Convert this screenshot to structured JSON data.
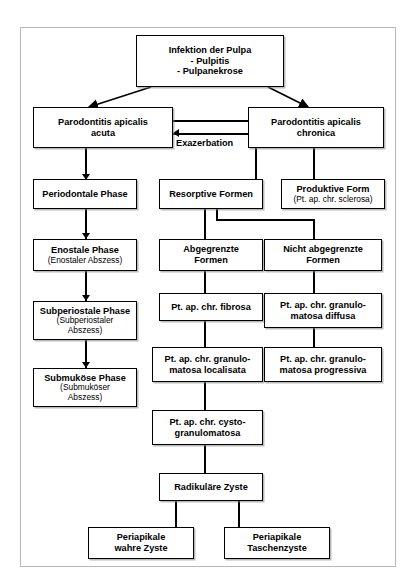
{
  "diagram": {
    "title_text": "",
    "frame_color": "#b9b9b9",
    "box_border_color": "#000000",
    "nodes": {
      "infektion": {
        "line1": "Infektion der Pulpa",
        "line2": "- Pulpitis\n- Pulpanekrose"
      },
      "pa_acuta": {
        "line1": "Parodontitis apicalis\nacuta",
        "line2": ""
      },
      "pa_chronica": {
        "line1": "Parodontitis apicalis\nchronica",
        "line2": ""
      },
      "periodontale": {
        "line1": "Periodontale Phase",
        "line2": ""
      },
      "resorptive": {
        "line1": "Resorptive Formen",
        "line2": ""
      },
      "produktive": {
        "line1": "Produktive Form",
        "line2": "(Pt. ap. chr. sclerosa)"
      },
      "enostale": {
        "line1": "Enostale Phase",
        "line2": "(Enostaler Abszess)"
      },
      "abgegrenzte": {
        "line1": "Abgegrenzte\nFormen",
        "line2": ""
      },
      "nicht_abgegrenzte": {
        "line1": "Nicht abgegrenzte\nFormen",
        "line2": ""
      },
      "subperiostale": {
        "line1": "Subperiostale Phase",
        "line2": "(Subperiostaler\nAbszess)"
      },
      "fibrosa": {
        "line1": "Pt. ap. chr. fibrosa",
        "line2": ""
      },
      "granulomatosa_diffusa": {
        "line1": "Pt. ap. chr. granulo-\nmatosa diffusa",
        "line2": ""
      },
      "submukoese": {
        "line1": "Submuköse Phase",
        "line2": "(Submuköser\nAbszess)"
      },
      "granulomatosa_localisata": {
        "line1": "Pt. ap. chr. granulo-\nmatosa localisata",
        "line2": ""
      },
      "granulomatosa_progressiva": {
        "line1": "Pt. ap. chr. granulo-\nmatosa progressiva",
        "line2": ""
      },
      "cysto": {
        "line1": "Pt. ap. chr. cysto-\ngranulomatosa",
        "line2": ""
      },
      "radikulaere": {
        "line1": "Radikuläre Zyste",
        "line2": ""
      },
      "wahre_zyste": {
        "line1": "Periapikale\nwahre Zyste",
        "line2": ""
      },
      "taschenzyste": {
        "line1": "Periapikale\nTaschenzyste",
        "line2": ""
      }
    },
    "labels": {
      "exazerbation": "Exazerbation"
    }
  }
}
